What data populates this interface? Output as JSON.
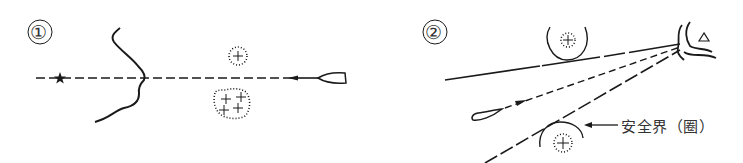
{
  "panel1": {
    "label": "①",
    "elements": [
      "coastline",
      "star-landmark",
      "leading-line",
      "boat",
      "shoal-small",
      "shoal-large"
    ]
  },
  "panel2": {
    "label": "②",
    "annotation": "安全界（圈）",
    "elements": [
      "coastline",
      "triangle-landmark",
      "clearing-line-upper",
      "course-line",
      "clearing-line-lower",
      "safety-arc-upper",
      "safety-arc-lower",
      "boat",
      "shoal-upper",
      "shoal-lower"
    ]
  },
  "colors": {
    "ink": "#1a1a1a",
    "background": "#ffffff"
  }
}
